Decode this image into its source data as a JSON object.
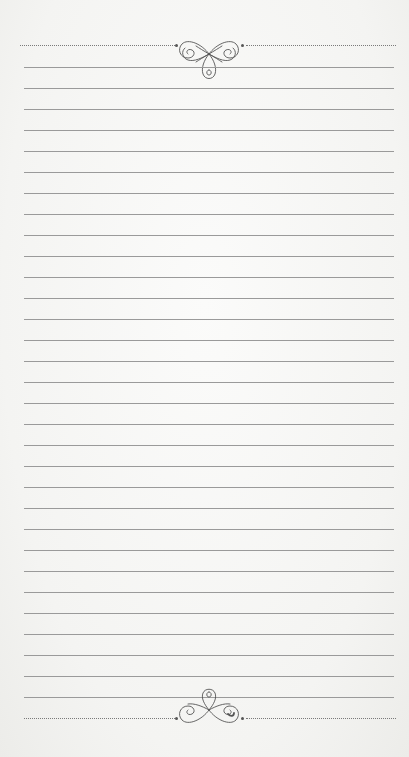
{
  "page": {
    "type": "lined-notepaper",
    "background_color": "#f6f6f4",
    "line_color": "#9a9a9a",
    "ornament_color": "#555555"
  },
  "header_border": {
    "style": "dotted",
    "ornament": "flourish-scroll-icon"
  },
  "footer_border": {
    "style": "dotted",
    "ornament": "flourish-scroll-icon"
  },
  "ruled_lines": {
    "count": 31,
    "first_y": 67,
    "spacing": 21
  }
}
